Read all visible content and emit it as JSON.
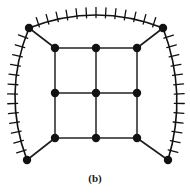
{
  "figure": {
    "caption": "(b)",
    "type": "graph-diagram",
    "colors": {
      "background": "#ffffff",
      "boundary_stroke": "#111111",
      "grid_stroke": "#5a5a5a",
      "spoke_stroke": "#1d1d1d",
      "vertex_fill": "#121212",
      "caption_text": "#1a1a1a"
    },
    "strokes": {
      "boundary_width": 1.6,
      "hatch_width": 1.3,
      "grid_width": 2.0,
      "spoke_width": 1.6,
      "vertex_radius": 4.2
    }
  },
  "graph": {
    "inner_vertices": [
      {
        "id": "g00",
        "x": 55,
        "y": 48,
        "label": "inner-top-left"
      },
      {
        "id": "g10",
        "x": 96,
        "y": 48,
        "label": "inner-top-center"
      },
      {
        "id": "g20",
        "x": 137,
        "y": 48,
        "label": "inner-top-right"
      },
      {
        "id": "g01",
        "x": 55,
        "y": 93,
        "label": "inner-mid-left"
      },
      {
        "id": "g11",
        "x": 96,
        "y": 93,
        "label": "inner-center"
      },
      {
        "id": "g21",
        "x": 137,
        "y": 93,
        "label": "inner-mid-right"
      },
      {
        "id": "g02",
        "x": 55,
        "y": 138,
        "label": "inner-bottom-left"
      },
      {
        "id": "g12",
        "x": 96,
        "y": 138,
        "label": "inner-bottom-center"
      },
      {
        "id": "g22",
        "x": 137,
        "y": 138,
        "label": "inner-bottom-right"
      }
    ],
    "outer_vertices": [
      {
        "id": "o-tl",
        "x": 29,
        "y": 28,
        "label": "outer-top-left"
      },
      {
        "id": "o-tr",
        "x": 163,
        "y": 28,
        "label": "outer-top-right"
      },
      {
        "id": "o-bl",
        "x": 27,
        "y": 160,
        "label": "outer-bottom-left"
      },
      {
        "id": "o-br",
        "x": 168,
        "y": 160,
        "label": "outer-bottom-right"
      }
    ],
    "grid_edges": [
      [
        "g00",
        "g10"
      ],
      [
        "g10",
        "g20"
      ],
      [
        "g01",
        "g11"
      ],
      [
        "g11",
        "g21"
      ],
      [
        "g02",
        "g12"
      ],
      [
        "g12",
        "g22"
      ],
      [
        "g00",
        "g01"
      ],
      [
        "g01",
        "g02"
      ],
      [
        "g10",
        "g11"
      ],
      [
        "g11",
        "g12"
      ],
      [
        "g20",
        "g21"
      ],
      [
        "g21",
        "g22"
      ]
    ],
    "spoke_edges": [
      [
        "o-tl",
        "g00"
      ],
      [
        "o-tr",
        "g20"
      ],
      [
        "o-bl",
        "g02"
      ],
      [
        "o-br",
        "g22"
      ]
    ],
    "boundary_arcs": [
      {
        "id": "arc-top",
        "from": "o-tl",
        "to": "o-tr",
        "control": {
          "x": 96,
          "y": 2
        },
        "hatch_count": 13,
        "hatch_side": "outward"
      },
      {
        "id": "arc-left",
        "from": "o-tl",
        "to": "o-bl",
        "control": {
          "x": 2,
          "y": 94
        },
        "hatch_count": 13,
        "hatch_side": "outward"
      },
      {
        "id": "arc-right",
        "from": "o-tr",
        "to": "o-br",
        "control": {
          "x": 188,
          "y": 94
        },
        "hatch_count": 13,
        "hatch_side": "outward"
      }
    ],
    "hatch_length": 9,
    "open_side": "bottom"
  }
}
